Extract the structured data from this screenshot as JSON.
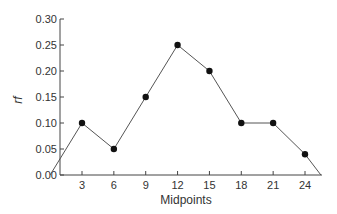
{
  "chart_data": {
    "type": "line",
    "title": "",
    "xlabel": "Midpoints",
    "ylabel": "rf",
    "x": [
      0,
      3,
      6,
      9,
      12,
      15,
      18,
      21,
      24,
      25.5
    ],
    "series": [
      {
        "name": "rf",
        "values": [
          0.0,
          0.1,
          0.05,
          0.15,
          0.25,
          0.2,
          0.1,
          0.1,
          0.04,
          0.0
        ]
      }
    ],
    "markers": {
      "x": [
        3,
        6,
        9,
        12,
        15,
        18,
        21,
        24
      ],
      "y": [
        0.1,
        0.05,
        0.15,
        0.25,
        0.2,
        0.1,
        0.1,
        0.04
      ]
    },
    "x_ticks": [
      "3",
      "6",
      "9",
      "12",
      "15",
      "18",
      "21",
      "24"
    ],
    "y_ticks": [
      "0.00",
      "0.05",
      "0.10",
      "0.15",
      "0.20",
      "0.25",
      "0.30"
    ],
    "ylim": [
      0,
      0.3
    ],
    "xlim": [
      1,
      26
    ],
    "grid": false,
    "legend": null,
    "colors": {
      "line": "#555555",
      "marker": "#111111",
      "axis": "#444444"
    }
  }
}
